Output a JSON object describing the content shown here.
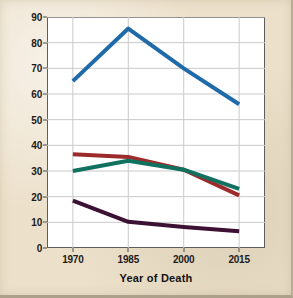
{
  "figure": {
    "background_color": "#ece0ca",
    "plot_background_color": "#ffffff",
    "border_color": "#5d5d5d"
  },
  "chart_data": {
    "type": "line",
    "title": "",
    "subtitle": "",
    "xlabel": "Year of Death",
    "ylabel": "Death rate per 100,000",
    "x": [
      1970,
      1985,
      2000,
      2015
    ],
    "categories": [
      "1970",
      "1985",
      "2000",
      "2015"
    ],
    "xlim": [
      1963,
      2022
    ],
    "ylim": [
      0,
      90
    ],
    "ytick_labels": [
      "0",
      "10",
      "20",
      "30",
      "40",
      "50",
      "60",
      "70",
      "80",
      "90"
    ],
    "yticks": [
      0,
      10,
      20,
      30,
      40,
      50,
      60,
      70,
      80,
      90
    ],
    "xtick_labels": [
      "1970",
      "1985",
      "2000",
      "2015"
    ],
    "xticks": [
      1970,
      1985,
      2000,
      2015
    ],
    "grid": true,
    "grid_axis": "y",
    "grid_color": "#c9c9c9",
    "legend": false,
    "legend_position": "none",
    "annotations": [],
    "series": [
      {
        "name": "series-blue",
        "color": "#1f6aa8",
        "values": [
          65,
          85.5,
          70,
          56
        ],
        "line_width": 4
      },
      {
        "name": "series-red",
        "color": "#9e2b2b",
        "values": [
          36.5,
          35.5,
          30.5,
          20.5
        ],
        "line_width": 4
      },
      {
        "name": "series-green",
        "color": "#11715f",
        "values": [
          30,
          34,
          30.5,
          23
        ],
        "line_width": 4
      },
      {
        "name": "series-purple",
        "color": "#3d1133",
        "values": [
          18.5,
          10.2,
          8.2,
          6.5
        ],
        "line_width": 4
      }
    ]
  }
}
